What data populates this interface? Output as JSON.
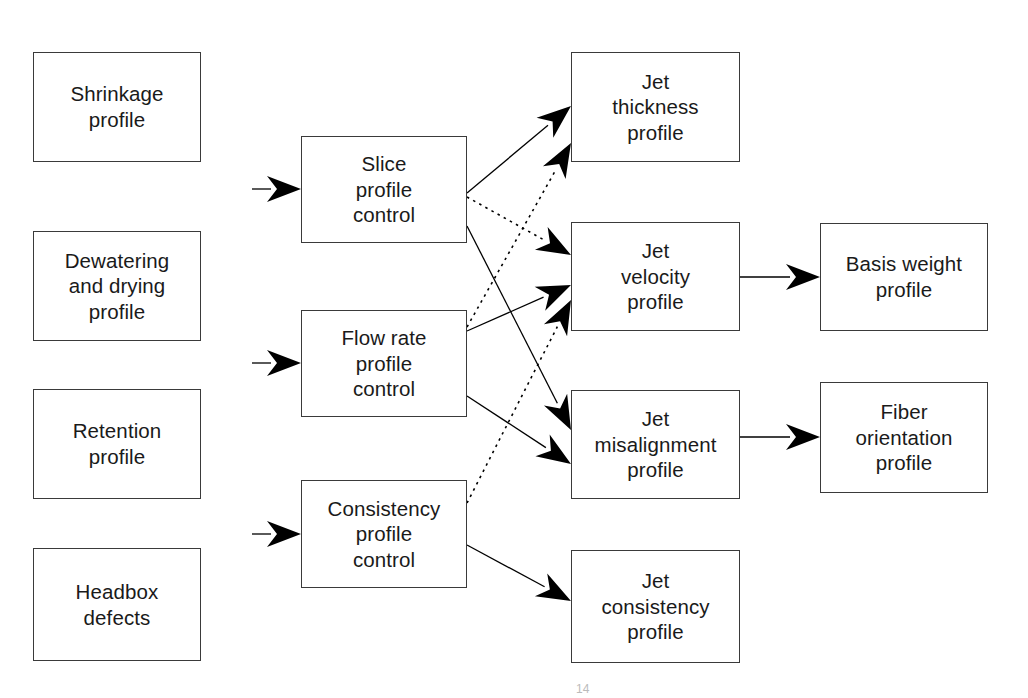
{
  "diagram": {
    "type": "flowchart",
    "background_color": "#ffffff",
    "box_border_color": "#3a3a3a",
    "text_color": "#1a1a1a",
    "arrow_color": "#000000",
    "columns": [
      {
        "name": "disturbances",
        "label": "Disturbance sources"
      },
      {
        "name": "controls",
        "label": "Profile controls"
      },
      {
        "name": "jet_profiles",
        "label": "Jet profiles"
      },
      {
        "name": "sheet_profiles",
        "label": "Sheet profiles"
      }
    ],
    "nodes": [
      {
        "id": "shrinkage",
        "label": "Shrinkage\nprofile",
        "column": "disturbances",
        "x": 33,
        "y": 52,
        "w": 168,
        "h": 110
      },
      {
        "id": "dewatering",
        "label": "Dewatering\nand drying\nprofile",
        "column": "disturbances",
        "x": 33,
        "y": 231,
        "w": 168,
        "h": 110
      },
      {
        "id": "retention",
        "label": "Retention\nprofile",
        "column": "disturbances",
        "x": 33,
        "y": 389,
        "w": 168,
        "h": 110
      },
      {
        "id": "headbox",
        "label": "Headbox\ndefects",
        "column": "disturbances",
        "x": 33,
        "y": 548,
        "w": 168,
        "h": 113
      },
      {
        "id": "slice_ctrl",
        "label": "Slice\nprofile\ncontrol",
        "column": "controls",
        "x": 301,
        "y": 136,
        "w": 166,
        "h": 107
      },
      {
        "id": "flow_ctrl",
        "label": "Flow rate\nprofile\ncontrol",
        "column": "controls",
        "x": 301,
        "y": 310,
        "w": 166,
        "h": 107
      },
      {
        "id": "cons_ctrl",
        "label": "Consistency\nprofile\ncontrol",
        "column": "controls",
        "x": 301,
        "y": 480,
        "w": 166,
        "h": 108
      },
      {
        "id": "jet_thick",
        "label": "Jet\nthickness\nprofile",
        "column": "jet_profiles",
        "x": 571,
        "y": 52,
        "w": 169,
        "h": 110
      },
      {
        "id": "jet_vel",
        "label": "Jet\nvelocity\nprofile",
        "column": "jet_profiles",
        "x": 571,
        "y": 222,
        "w": 169,
        "h": 109
      },
      {
        "id": "jet_misalign",
        "label": "Jet\nmisalignment\nprofile",
        "column": "jet_profiles",
        "x": 571,
        "y": 390,
        "w": 169,
        "h": 109
      },
      {
        "id": "jet_cons",
        "label": "Jet\nconsistency\nprofile",
        "column": "jet_profiles",
        "x": 571,
        "y": 550,
        "w": 169,
        "h": 113
      },
      {
        "id": "basis_weight",
        "label": "Basis weight\nprofile",
        "column": "sheet_profiles",
        "x": 820,
        "y": 223,
        "w": 168,
        "h": 108
      },
      {
        "id": "fiber_orient",
        "label": "Fiber\norientation\nprofile",
        "column": "sheet_profiles",
        "x": 820,
        "y": 382,
        "w": 168,
        "h": 111
      }
    ],
    "edges": [
      {
        "id": "e-in-slice",
        "from": "external",
        "to": "slice_ctrl",
        "style": "solid",
        "x1": 252,
        "y1": 189,
        "x2": 301,
        "y2": 189
      },
      {
        "id": "e-in-flow",
        "from": "external",
        "to": "flow_ctrl",
        "style": "solid",
        "x1": 252,
        "y1": 363,
        "x2": 301,
        "y2": 363
      },
      {
        "id": "e-in-cons",
        "from": "external",
        "to": "cons_ctrl",
        "style": "solid",
        "x1": 252,
        "y1": 534,
        "x2": 301,
        "y2": 534
      },
      {
        "id": "e-slice-thick",
        "from": "slice_ctrl",
        "to": "jet_thick",
        "style": "solid",
        "x1": 467,
        "y1": 193,
        "x2": 571,
        "y2": 106
      },
      {
        "id": "e-slice-vel",
        "from": "slice_ctrl",
        "to": "jet_vel",
        "style": "dotted",
        "x1": 467,
        "y1": 197,
        "x2": 571,
        "y2": 255
      },
      {
        "id": "e-slice-mis",
        "from": "slice_ctrl",
        "to": "jet_misalign",
        "style": "solid",
        "x1": 467,
        "y1": 226,
        "x2": 571,
        "y2": 430
      },
      {
        "id": "e-flow-thick",
        "from": "flow_ctrl",
        "to": "jet_thick",
        "style": "dotted",
        "x1": 467,
        "y1": 327,
        "x2": 571,
        "y2": 143
      },
      {
        "id": "e-flow-vel",
        "from": "flow_ctrl",
        "to": "jet_vel",
        "style": "solid",
        "x1": 467,
        "y1": 331,
        "x2": 571,
        "y2": 285
      },
      {
        "id": "e-flow-mis",
        "from": "flow_ctrl",
        "to": "jet_misalign",
        "style": "solid",
        "x1": 467,
        "y1": 396,
        "x2": 571,
        "y2": 464
      },
      {
        "id": "e-cons-vel",
        "from": "cons_ctrl",
        "to": "jet_vel",
        "style": "dotted",
        "x1": 467,
        "y1": 503,
        "x2": 571,
        "y2": 300
      },
      {
        "id": "e-cons-jcons",
        "from": "cons_ctrl",
        "to": "jet_cons",
        "style": "solid",
        "x1": 467,
        "y1": 545,
        "x2": 571,
        "y2": 601
      },
      {
        "id": "e-vel-bw",
        "from": "jet_vel",
        "to": "basis_weight",
        "style": "solid",
        "x1": 740,
        "y1": 277,
        "x2": 820,
        "y2": 277
      },
      {
        "id": "e-mis-fo",
        "from": "jet_misalign",
        "to": "fiber_orient",
        "style": "solid",
        "x1": 740,
        "y1": 437,
        "x2": 820,
        "y2": 437
      }
    ],
    "legend": {
      "solid_meaning": "direct effect",
      "dotted_meaning": "cross effect"
    }
  },
  "footer": {
    "page_mark": "14"
  }
}
